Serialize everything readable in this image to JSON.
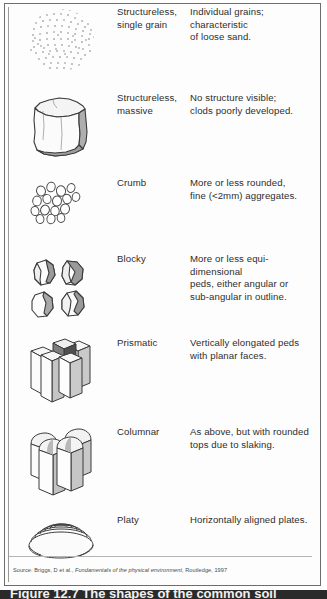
{
  "figure": {
    "source_prefix": "Source: ",
    "source_author": "Briggs, D et al., ",
    "source_title": "Fundamentals of the physical environment",
    "source_suffix": ", Routledge, 1997",
    "caption": "Figure 12.7  The shapes of the common soil"
  },
  "colors": {
    "border": "#6d6d6d",
    "text": "#2e2e2e",
    "source_text": "#4a4a4a",
    "ink": "#3a3a3a",
    "shade_dark": "#8f8f8f",
    "shade_mid": "#bcbcbc",
    "shade_light": "#e4e4e4",
    "background": "#ffffff",
    "caption_bar": "#2a2a2a"
  },
  "rows": [
    {
      "icon": "single-grain-icon",
      "name": "Structureless,\nsingle grain",
      "description": "Individual grains;\ncharacteristic\nof loose sand."
    },
    {
      "icon": "massive-block-icon",
      "name": "Structureless,\nmassive",
      "description": "No structure visible;\nclods poorly developed."
    },
    {
      "icon": "crumb-icon",
      "name": "Crumb",
      "description": "More or less rounded,\nfine (<2mm) aggregates."
    },
    {
      "icon": "blocky-icon",
      "name": "Blocky",
      "description": "More or less equi-dimensional\npeds, either angular or\nsub-angular in outline."
    },
    {
      "icon": "prismatic-icon",
      "name": "Prismatic",
      "description": "Vertically elongated peds\nwith planar faces."
    },
    {
      "icon": "columnar-icon",
      "name": "Columnar",
      "description": "As above, but with rounded\ntops due to slaking."
    },
    {
      "icon": "platy-icon",
      "name": "Platy",
      "description": "Horizontally aligned plates."
    }
  ]
}
